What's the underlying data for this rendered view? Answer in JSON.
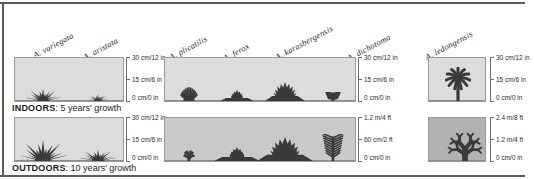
{
  "figure": {
    "rows": [
      {
        "id": "indoors",
        "caption_label": "INDOORS",
        "caption_text": ": 5 years' growth",
        "panels": [
          {
            "id": "indoors-panel-1",
            "background": "#dcdcdc",
            "scale": {
              "ticks": [
                "30 cm/12 in",
                "15 cm/6 in",
                "0 cm/0 in"
              ]
            },
            "plants": [
              {
                "name": "A. variegata",
                "shape": "spiky-star",
                "height_ratio": 0.3,
                "width": 34
              },
              {
                "name": "A. aristata",
                "shape": "spiky-star",
                "height_ratio": 0.17,
                "width": 22
              }
            ]
          },
          {
            "id": "indoors-panel-2",
            "background": "#dcdcdc",
            "scale": {
              "ticks": [
                "30 cm/12 in",
                "15 cm/6 in",
                "0 cm/0 in"
              ]
            },
            "plants": [
              {
                "name": "A. plicatilis",
                "shape": "fan-grass",
                "height_ratio": 0.33,
                "width": 30
              },
              {
                "name": "A. ferox",
                "shape": "rosette-low",
                "height_ratio": 0.27,
                "width": 34
              },
              {
                "name": "A. karasbergensis",
                "shape": "rosette-tall",
                "height_ratio": 0.44,
                "width": 40
              },
              {
                "name": "A. dichotoma",
                "shape": "sprig",
                "height_ratio": 0.22,
                "width": 16
              }
            ]
          },
          {
            "id": "indoors-panel-3",
            "background": "#dcdcdc",
            "scale": {
              "ticks": [
                "30 cm/12 in",
                "15 cm/6 in",
                "0 cm/0 in"
              ]
            },
            "plants": [
              {
                "name": "A. ledongensis",
                "shape": "palm-star",
                "height_ratio": 0.8,
                "width": 46
              }
            ]
          }
        ]
      },
      {
        "id": "outdoors",
        "caption_label": "OUTDOORS",
        "caption_text": ": 10 years' growth",
        "panels": [
          {
            "id": "outdoors-panel-1",
            "background": "#dcdcdc",
            "scale": {
              "ticks": [
                "30 cm/12 in",
                "15 cm/6 in",
                "0 cm/0 in"
              ]
            },
            "plants": [
              {
                "name": "A. variegata",
                "shape": "spiky-star",
                "height_ratio": 0.5,
                "width": 48
              },
              {
                "name": "A. aristata",
                "shape": "spiky-star",
                "height_ratio": 0.28,
                "width": 36
              }
            ]
          },
          {
            "id": "outdoors-panel-2",
            "background": "#c9c9c9",
            "scale": {
              "ticks": [
                "1.2 m/4 ft",
                "60 cm/2 ft",
                "0 cm/0 in"
              ]
            },
            "plants": [
              {
                "name": "A. plicatilis",
                "shape": "branching-shrub",
                "height_ratio": 0.38,
                "width": 40
              },
              {
                "name": "A. ferox",
                "shape": "rosette-low",
                "height_ratio": 0.34,
                "width": 46
              },
              {
                "name": "A. karasbergensis",
                "shape": "rosette-tall",
                "height_ratio": 0.55,
                "width": 56
              },
              {
                "name": "A. dichotoma",
                "shape": "sprig",
                "height_ratio": 0.62,
                "width": 22
              }
            ]
          },
          {
            "id": "outdoors-panel-3",
            "background": "#b2b2b2",
            "scale": {
              "ticks": [
                "2.4 m/8 ft",
                "1.2 m/4 ft",
                "0 cm/0 in"
              ]
            },
            "plants": [
              {
                "name": "A. ledongensis",
                "shape": "branching-tree",
                "height_ratio": 0.82,
                "width": 68
              }
            ]
          }
        ]
      }
    ],
    "species_labels": [
      {
        "name": "A. variegata",
        "x": 36,
        "y": 50
      },
      {
        "name": "A. aristata",
        "x": 86,
        "y": 52
      },
      {
        "name": "A. plicatilis",
        "x": 172,
        "y": 52
      },
      {
        "name": "A. ferox",
        "x": 226,
        "y": 53
      },
      {
        "name": "A. karasbergensis",
        "x": 278,
        "y": 52
      },
      {
        "name": "A. dichotoma",
        "x": 350,
        "y": 53
      },
      {
        "name": "A. ledongensis",
        "x": 428,
        "y": 52
      }
    ],
    "colors": {
      "plant": "#3a3a3a",
      "panel_light": "#dcdcdc",
      "panel_mid": "#c9c9c9",
      "panel_dark": "#b2b2b2",
      "rule": "#5b5b5b",
      "text": "#1b1b1b"
    }
  }
}
